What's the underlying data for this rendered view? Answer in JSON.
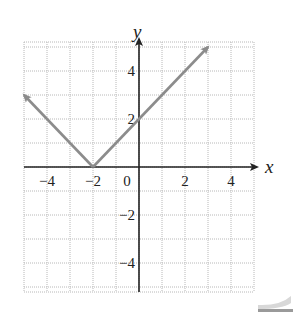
{
  "chart_data": {
    "type": "line",
    "title": "",
    "function": "y = |x + 2|",
    "xlabel": "x",
    "ylabel": "y",
    "xlim": [
      -5,
      5
    ],
    "ylim": [
      -5,
      5
    ],
    "grid": true,
    "x_ticks": [
      {
        "value": -4,
        "label": "−4"
      },
      {
        "value": -2,
        "label": "−2"
      },
      {
        "value": 0,
        "label": "0"
      },
      {
        "value": 2,
        "label": "2"
      },
      {
        "value": 4,
        "label": "4"
      }
    ],
    "y_ticks": [
      {
        "value": 4,
        "label": "4"
      },
      {
        "value": 2,
        "label": "2"
      },
      {
        "value": -2,
        "label": "−2"
      },
      {
        "value": -4,
        "label": "−4"
      }
    ],
    "series": [
      {
        "name": "y = |x + 2|",
        "x": [
          -5,
          -2,
          3
        ],
        "y": [
          3,
          0,
          5
        ],
        "arrows_at_ends": true,
        "color": "#8c8c8c"
      }
    ]
  },
  "colors": {
    "grid": "#b8b8b8",
    "axis": "#222222",
    "curve": "#8c8c8c"
  }
}
